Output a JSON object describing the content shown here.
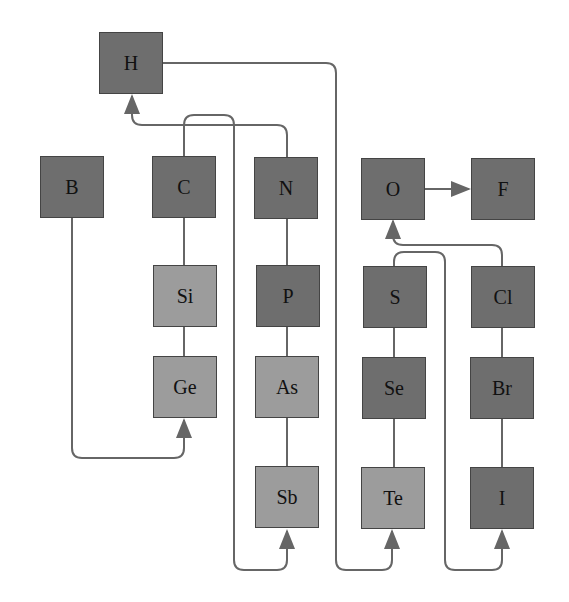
{
  "elements": {
    "H": {
      "label": "H",
      "x": 99,
      "y": 32,
      "shade": "dark"
    },
    "B": {
      "label": "B",
      "x": 40,
      "y": 156,
      "shade": "dark"
    },
    "C": {
      "label": "C",
      "x": 152,
      "y": 156,
      "shade": "dark"
    },
    "N": {
      "label": "N",
      "x": 254,
      "y": 157,
      "shade": "dark"
    },
    "O": {
      "label": "O",
      "x": 361,
      "y": 158,
      "shade": "dark"
    },
    "F": {
      "label": "F",
      "x": 471,
      "y": 158,
      "shade": "dark"
    },
    "Si": {
      "label": "Si",
      "x": 153,
      "y": 265,
      "shade": "light"
    },
    "P": {
      "label": "P",
      "x": 256,
      "y": 265,
      "shade": "dark"
    },
    "S": {
      "label": "S",
      "x": 363,
      "y": 266,
      "shade": "dark"
    },
    "Cl": {
      "label": "Cl",
      "x": 471,
      "y": 266,
      "shade": "dark"
    },
    "Ge": {
      "label": "Ge",
      "x": 153,
      "y": 356,
      "shade": "light"
    },
    "As": {
      "label": "As",
      "x": 255,
      "y": 356,
      "shade": "light"
    },
    "Se": {
      "label": "Se",
      "x": 362,
      "y": 357,
      "shade": "dark"
    },
    "Br": {
      "label": "Br",
      "x": 470,
      "y": 357,
      "shade": "dark"
    },
    "Sb": {
      "label": "Sb",
      "x": 255,
      "y": 466,
      "shade": "light"
    },
    "Te": {
      "label": "Te",
      "x": 361,
      "y": 467,
      "shade": "light"
    },
    "I": {
      "label": "I",
      "x": 470,
      "y": 467,
      "shade": "dark"
    }
  },
  "colors": {
    "dark": "#6e6e6e",
    "light": "#9c9c9c",
    "line": "#666666"
  }
}
